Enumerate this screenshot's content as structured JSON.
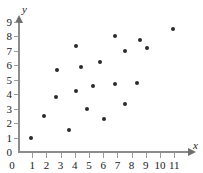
{
  "chart_data": {
    "type": "scatter",
    "title": "",
    "xlabel": "x",
    "ylabel": "y",
    "xlim": [
      0,
      11.6
    ],
    "ylim": [
      0,
      9.3
    ],
    "grid": false,
    "legend": null,
    "x_ticks": [
      0,
      1,
      2,
      3,
      4,
      5,
      6,
      7,
      8,
      9,
      10,
      11
    ],
    "y_ticks": [
      0,
      1,
      2,
      3,
      4,
      5,
      6,
      7,
      8,
      9
    ],
    "x_tick_labels": [
      "0",
      "1",
      "2",
      "3",
      "4",
      "5",
      "6",
      "7",
      "8",
      "9",
      "10",
      "11"
    ],
    "y_tick_labels": [
      "0",
      "1",
      "2",
      "3",
      "4",
      "5",
      "6",
      "7",
      "8",
      "9"
    ],
    "marker": "filled-circle",
    "marker_color": "#2b2b2b",
    "axis_color": "#8c8c8c",
    "points": [
      {
        "x": 0.9,
        "y": 1.0
      },
      {
        "x": 1.8,
        "y": 2.5
      },
      {
        "x": 2.7,
        "y": 3.8
      },
      {
        "x": 2.75,
        "y": 5.7
      },
      {
        "x": 3.6,
        "y": 1.5
      },
      {
        "x": 4.05,
        "y": 4.25
      },
      {
        "x": 4.1,
        "y": 7.35
      },
      {
        "x": 4.45,
        "y": 5.9
      },
      {
        "x": 4.85,
        "y": 3.0
      },
      {
        "x": 5.3,
        "y": 4.6
      },
      {
        "x": 5.8,
        "y": 6.2
      },
      {
        "x": 6.05,
        "y": 2.3
      },
      {
        "x": 6.85,
        "y": 8.0
      },
      {
        "x": 6.85,
        "y": 4.7
      },
      {
        "x": 7.5,
        "y": 3.3
      },
      {
        "x": 7.55,
        "y": 7.0
      },
      {
        "x": 8.35,
        "y": 4.75
      },
      {
        "x": 8.6,
        "y": 7.75
      },
      {
        "x": 9.1,
        "y": 7.2
      },
      {
        "x": 10.9,
        "y": 8.5
      }
    ]
  },
  "axes": {
    "x_name": "x",
    "y_name": "y"
  }
}
